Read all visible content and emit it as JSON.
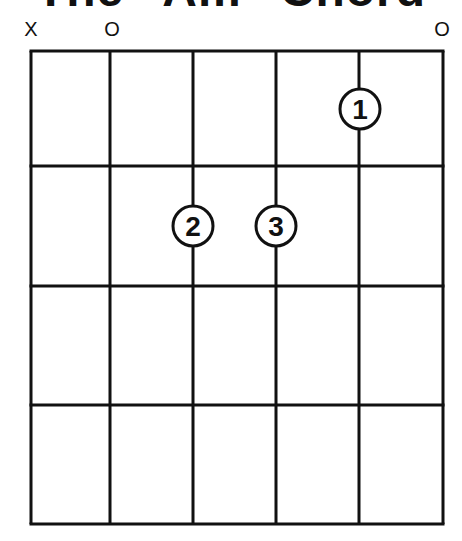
{
  "title": "The \"Am\" Chord",
  "chord": {
    "name": "Am",
    "strings": 6,
    "frets_shown": 4,
    "string_markers": [
      {
        "string": 1,
        "marker": "X",
        "x": 31
      },
      {
        "string": 2,
        "marker": "O",
        "x": 112
      },
      {
        "string": 6,
        "marker": "O",
        "x": 442
      }
    ],
    "fingers": [
      {
        "label": "1",
        "string": 5,
        "fret": 1,
        "cx": 360,
        "cy": 109
      },
      {
        "label": "2",
        "string": 3,
        "fret": 2,
        "cx": 193,
        "cy": 226
      },
      {
        "label": "3",
        "string": 4,
        "fret": 2,
        "cx": 276,
        "cy": 226
      }
    ]
  },
  "layout": {
    "string_x": [
      31,
      110,
      193,
      276,
      359,
      443
    ],
    "fret_y": [
      51,
      166,
      286,
      405,
      524
    ],
    "line_color": "#111111",
    "background": "#ffffff"
  }
}
